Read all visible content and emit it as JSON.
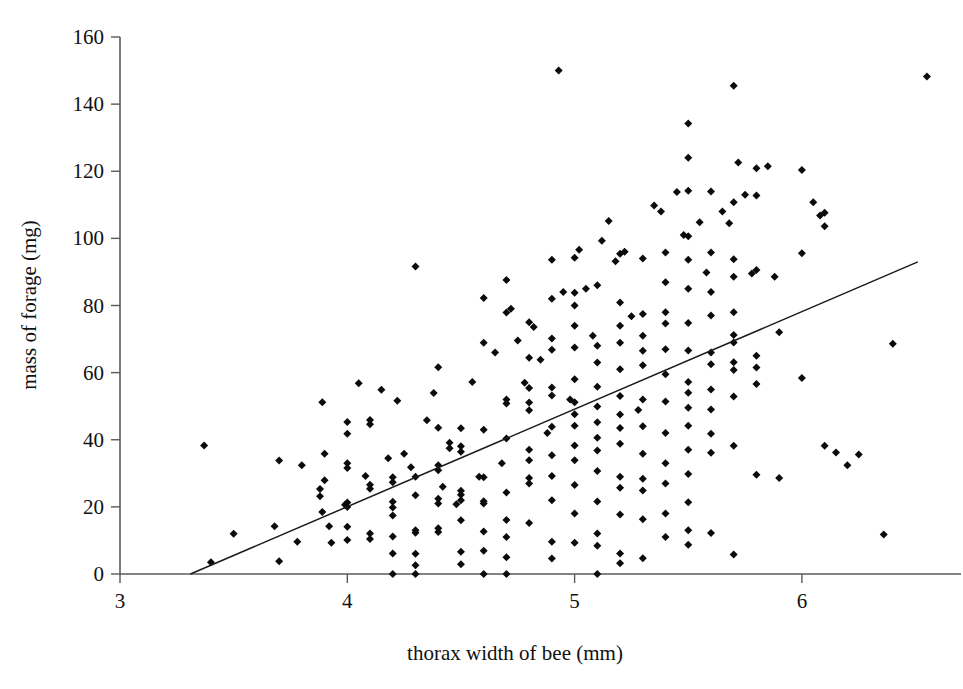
{
  "figure": {
    "background_color": "#ffffff",
    "marker_color": "#0b0b0b",
    "line_color": "#1a1a1a",
    "axis_color": "#5a5a5a"
  },
  "chart_data": {
    "type": "scatter",
    "title": "",
    "xlabel": "thorax width of bee (mm)",
    "ylabel": "mass of forage (mg)",
    "xlim": [
      3,
      6.7
    ],
    "ylim": [
      0,
      160
    ],
    "xticks": [
      3,
      4,
      5,
      6
    ],
    "yticks": [
      0,
      20,
      40,
      60,
      80,
      100,
      120,
      140,
      160
    ],
    "xtick_labels": [
      "3",
      "4",
      "5",
      "6"
    ],
    "ytick_labels": [
      "0",
      "20",
      "40",
      "60",
      "80",
      "100",
      "120",
      "140",
      "160"
    ],
    "grid": false,
    "legend": false,
    "marker_shape": "diamond",
    "marker_size": 8,
    "n_points": 452,
    "trendline": {
      "type": "linear-regression",
      "x_start": 3.31,
      "y_start": 0,
      "x_end": 6.51,
      "y_end": 93,
      "slope": 29.06,
      "intercept": -96.2
    },
    "points": [
      [
        3.37,
        38.3
      ],
      [
        3.4,
        3.5
      ],
      [
        3.5,
        12.0
      ],
      [
        3.68,
        14.2
      ],
      [
        3.7,
        3.8
      ],
      [
        3.7,
        33.8
      ],
      [
        3.78,
        9.6
      ],
      [
        3.8,
        32.4
      ],
      [
        3.88,
        23.2
      ],
      [
        3.88,
        25.3
      ],
      [
        3.89,
        18.5
      ],
      [
        3.89,
        51.2
      ],
      [
        3.9,
        35.8
      ],
      [
        3.9,
        27.9
      ],
      [
        3.92,
        14.2
      ],
      [
        3.93,
        9.3
      ],
      [
        3.99,
        20.6
      ],
      [
        4.0,
        20.0
      ],
      [
        4.0,
        21.3
      ],
      [
        4.0,
        33.0
      ],
      [
        4.0,
        31.6
      ],
      [
        4.0,
        45.3
      ],
      [
        4.0,
        41.8
      ],
      [
        4.0,
        14.1
      ],
      [
        4.0,
        10.1
      ],
      [
        4.05,
        56.8
      ],
      [
        4.08,
        29.2
      ],
      [
        4.1,
        25.4
      ],
      [
        4.1,
        26.6
      ],
      [
        4.1,
        45.9
      ],
      [
        4.1,
        44.6
      ],
      [
        4.1,
        12.1
      ],
      [
        4.1,
        10.4
      ],
      [
        4.15,
        54.9
      ],
      [
        4.18,
        34.5
      ],
      [
        4.2,
        28.8
      ],
      [
        4.2,
        27.3
      ],
      [
        4.2,
        21.5
      ],
      [
        4.2,
        19.8
      ],
      [
        4.2,
        17.4
      ],
      [
        4.2,
        11.2
      ],
      [
        4.2,
        6.1
      ],
      [
        4.2,
        0.0
      ],
      [
        4.22,
        51.6
      ],
      [
        4.25,
        35.8
      ],
      [
        4.28,
        31.8
      ],
      [
        4.3,
        91.6
      ],
      [
        4.3,
        29.0
      ],
      [
        4.3,
        23.5
      ],
      [
        4.3,
        13.0
      ],
      [
        4.3,
        12.3
      ],
      [
        4.3,
        6.0
      ],
      [
        4.3,
        2.6
      ],
      [
        4.3,
        0.0
      ],
      [
        4.35,
        45.8
      ],
      [
        4.38,
        53.9
      ],
      [
        4.4,
        61.6
      ],
      [
        4.4,
        43.6
      ],
      [
        4.4,
        32.4
      ],
      [
        4.4,
        30.9
      ],
      [
        4.4,
        22.4
      ],
      [
        4.4,
        21.0
      ],
      [
        4.4,
        13.6
      ],
      [
        4.4,
        12.5
      ],
      [
        4.42,
        26.0
      ],
      [
        4.45,
        39.1
      ],
      [
        4.45,
        37.5
      ],
      [
        4.48,
        20.8
      ],
      [
        4.5,
        43.4
      ],
      [
        4.5,
        38.1
      ],
      [
        4.5,
        36.4
      ],
      [
        4.5,
        24.8
      ],
      [
        4.5,
        23.6
      ],
      [
        4.5,
        22.0
      ],
      [
        4.5,
        16.0
      ],
      [
        4.5,
        6.6
      ],
      [
        4.5,
        2.9
      ],
      [
        4.55,
        57.2
      ],
      [
        4.58,
        29.0
      ],
      [
        4.6,
        82.2
      ],
      [
        4.6,
        68.9
      ],
      [
        4.6,
        43.0
      ],
      [
        4.6,
        28.8
      ],
      [
        4.6,
        21.7
      ],
      [
        4.6,
        21.0
      ],
      [
        4.6,
        12.7
      ],
      [
        4.6,
        6.9
      ],
      [
        4.6,
        0.0
      ],
      [
        4.65,
        66.0
      ],
      [
        4.68,
        33.0
      ],
      [
        4.7,
        87.6
      ],
      [
        4.7,
        77.9
      ],
      [
        4.7,
        52.0
      ],
      [
        4.7,
        50.8
      ],
      [
        4.7,
        40.4
      ],
      [
        4.7,
        24.3
      ],
      [
        4.7,
        16.1
      ],
      [
        4.7,
        11.0
      ],
      [
        4.7,
        5.0
      ],
      [
        4.7,
        0.0
      ],
      [
        4.72,
        79.0
      ],
      [
        4.75,
        69.6
      ],
      [
        4.78,
        57.0
      ],
      [
        4.8,
        75.0
      ],
      [
        4.8,
        64.4
      ],
      [
        4.8,
        55.4
      ],
      [
        4.8,
        51.1
      ],
      [
        4.8,
        48.8
      ],
      [
        4.8,
        37.0
      ],
      [
        4.8,
        33.9
      ],
      [
        4.8,
        28.6
      ],
      [
        4.8,
        27.0
      ],
      [
        4.8,
        15.2
      ],
      [
        4.82,
        73.6
      ],
      [
        4.85,
        63.8
      ],
      [
        4.88,
        42.0
      ],
      [
        4.9,
        93.6
      ],
      [
        4.9,
        82.0
      ],
      [
        4.9,
        70.2
      ],
      [
        4.9,
        66.8
      ],
      [
        4.9,
        55.6
      ],
      [
        4.9,
        53.2
      ],
      [
        4.9,
        43.9
      ],
      [
        4.9,
        35.4
      ],
      [
        4.9,
        29.2
      ],
      [
        4.9,
        22.0
      ],
      [
        4.9,
        9.6
      ],
      [
        4.9,
        4.6
      ],
      [
        4.93,
        150.0
      ],
      [
        4.95,
        84.0
      ],
      [
        4.98,
        52.0
      ],
      [
        5.0,
        94.2
      ],
      [
        5.0,
        83.8
      ],
      [
        5.0,
        80.0
      ],
      [
        5.0,
        74.0
      ],
      [
        5.0,
        67.5
      ],
      [
        5.0,
        58.0
      ],
      [
        5.0,
        51.2
      ],
      [
        5.0,
        47.6
      ],
      [
        5.0,
        44.2
      ],
      [
        5.0,
        38.3
      ],
      [
        5.0,
        33.9
      ],
      [
        5.0,
        26.5
      ],
      [
        5.0,
        18.0
      ],
      [
        5.0,
        9.3
      ],
      [
        5.02,
        96.6
      ],
      [
        5.05,
        85.0
      ],
      [
        5.08,
        71.0
      ],
      [
        5.1,
        86.0
      ],
      [
        5.1,
        68.0
      ],
      [
        5.1,
        63.0
      ],
      [
        5.1,
        55.8
      ],
      [
        5.1,
        49.9
      ],
      [
        5.1,
        45.2
      ],
      [
        5.1,
        40.6
      ],
      [
        5.1,
        36.8
      ],
      [
        5.1,
        30.7
      ],
      [
        5.1,
        21.6
      ],
      [
        5.1,
        12.1
      ],
      [
        5.1,
        8.4
      ],
      [
        5.1,
        0.0
      ],
      [
        5.12,
        99.3
      ],
      [
        5.15,
        105.2
      ],
      [
        5.18,
        93.2
      ],
      [
        5.2,
        95.4
      ],
      [
        5.2,
        80.9
      ],
      [
        5.2,
        74.0
      ],
      [
        5.2,
        68.9
      ],
      [
        5.2,
        61.0
      ],
      [
        5.2,
        53.0
      ],
      [
        5.2,
        47.5
      ],
      [
        5.2,
        43.5
      ],
      [
        5.2,
        38.8
      ],
      [
        5.2,
        29.0
      ],
      [
        5.2,
        25.7
      ],
      [
        5.2,
        17.7
      ],
      [
        5.2,
        6.1
      ],
      [
        5.2,
        3.2
      ],
      [
        5.22,
        96.0
      ],
      [
        5.25,
        76.8
      ],
      [
        5.28,
        48.9
      ],
      [
        5.3,
        94.0
      ],
      [
        5.3,
        77.5
      ],
      [
        5.3,
        71.0
      ],
      [
        5.3,
        66.5
      ],
      [
        5.3,
        62.2
      ],
      [
        5.3,
        52.0
      ],
      [
        5.3,
        44.0
      ],
      [
        5.3,
        35.8
      ],
      [
        5.3,
        28.4
      ],
      [
        5.3,
        24.9
      ],
      [
        5.3,
        16.3
      ],
      [
        5.3,
        4.7
      ],
      [
        5.35,
        109.8
      ],
      [
        5.38,
        108.0
      ],
      [
        5.4,
        95.8
      ],
      [
        5.4,
        86.9
      ],
      [
        5.4,
        78.0
      ],
      [
        5.4,
        74.6
      ],
      [
        5.4,
        67.0
      ],
      [
        5.4,
        59.5
      ],
      [
        5.4,
        51.4
      ],
      [
        5.4,
        42.0
      ],
      [
        5.4,
        33.0
      ],
      [
        5.4,
        27.0
      ],
      [
        5.4,
        18.0
      ],
      [
        5.4,
        11.0
      ],
      [
        5.45,
        113.8
      ],
      [
        5.48,
        101.0
      ],
      [
        5.5,
        134.2
      ],
      [
        5.5,
        124.0
      ],
      [
        5.5,
        114.2
      ],
      [
        5.5,
        100.6
      ],
      [
        5.5,
        93.6
      ],
      [
        5.5,
        85.0
      ],
      [
        5.5,
        74.8
      ],
      [
        5.5,
        66.6
      ],
      [
        5.5,
        57.2
      ],
      [
        5.5,
        54.0
      ],
      [
        5.5,
        49.5
      ],
      [
        5.5,
        44.2
      ],
      [
        5.5,
        37.0
      ],
      [
        5.5,
        29.8
      ],
      [
        5.5,
        21.4
      ],
      [
        5.5,
        13.0
      ],
      [
        5.5,
        8.7
      ],
      [
        5.55,
        104.8
      ],
      [
        5.58,
        89.8
      ],
      [
        5.6,
        114.0
      ],
      [
        5.6,
        95.8
      ],
      [
        5.6,
        84.0
      ],
      [
        5.6,
        77.0
      ],
      [
        5.6,
        66.0
      ],
      [
        5.6,
        62.5
      ],
      [
        5.6,
        55.0
      ],
      [
        5.6,
        49.0
      ],
      [
        5.6,
        41.8
      ],
      [
        5.6,
        36.1
      ],
      [
        5.6,
        12.2
      ],
      [
        5.65,
        108.0
      ],
      [
        5.68,
        104.5
      ],
      [
        5.7,
        145.5
      ],
      [
        5.7,
        110.8
      ],
      [
        5.7,
        93.8
      ],
      [
        5.7,
        88.6
      ],
      [
        5.7,
        78.0
      ],
      [
        5.7,
        71.2
      ],
      [
        5.7,
        69.0
      ],
      [
        5.7,
        63.1
      ],
      [
        5.7,
        60.8
      ],
      [
        5.7,
        52.9
      ],
      [
        5.7,
        38.2
      ],
      [
        5.7,
        5.8
      ],
      [
        5.72,
        122.6
      ],
      [
        5.75,
        113.0
      ],
      [
        5.78,
        89.5
      ],
      [
        5.8,
        120.9
      ],
      [
        5.8,
        112.8
      ],
      [
        5.8,
        90.6
      ],
      [
        5.8,
        65.0
      ],
      [
        5.8,
        61.5
      ],
      [
        5.8,
        56.6
      ],
      [
        5.8,
        29.6
      ],
      [
        5.85,
        121.5
      ],
      [
        5.88,
        88.6
      ],
      [
        5.9,
        72.0
      ],
      [
        5.9,
        28.6
      ],
      [
        6.0,
        120.4
      ],
      [
        6.0,
        95.6
      ],
      [
        6.0,
        58.4
      ],
      [
        6.05,
        110.8
      ],
      [
        6.08,
        106.8
      ],
      [
        6.1,
        107.6
      ],
      [
        6.1,
        103.6
      ],
      [
        6.1,
        38.2
      ],
      [
        6.15,
        36.2
      ],
      [
        6.2,
        32.4
      ],
      [
        6.25,
        35.6
      ],
      [
        6.36,
        11.8
      ],
      [
        6.4,
        68.6
      ],
      [
        6.55,
        148.2
      ]
    ]
  }
}
